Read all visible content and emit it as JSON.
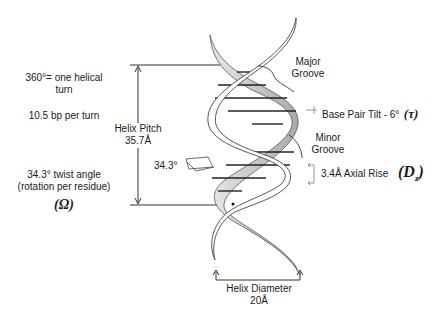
{
  "diagram": {
    "left_notes": {
      "turn_line1": "360°= one helical",
      "turn_line2": "turn",
      "bp_per_turn": "10.5 bp per turn",
      "twist_line1": "34.3° twist angle",
      "twist_line2": "(rotation per residue)",
      "twist_symbol": "(Ω)"
    },
    "helix_pitch": {
      "label": "Helix Pitch",
      "value": "35.7Å"
    },
    "twist_small_label": "34.3°",
    "major_groove": {
      "line1": "Major",
      "line2": "Groove"
    },
    "base_pair_tilt": {
      "label": "Base Pair Tilt - 6°",
      "symbol": "(τ)"
    },
    "minor_groove": {
      "line1": "Minor",
      "line2": "Groove"
    },
    "axial_rise": {
      "label": "3.4Å Axial Rise",
      "symbol": "D",
      "subscript": "z"
    },
    "helix_diameter": {
      "label": "Helix Diameter",
      "value": "20Å"
    },
    "colors": {
      "strand_fill": "#ffffff",
      "strand_shade": "#bdbdbd",
      "line": "#333333"
    }
  }
}
